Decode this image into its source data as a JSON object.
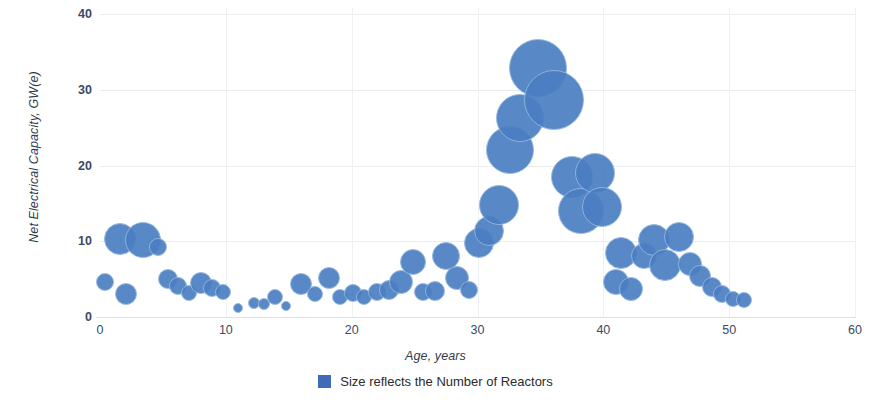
{
  "chart_data": {
    "type": "scatter",
    "title": "",
    "xlabel": "Age, years",
    "ylabel": "Net Electrical Capacity, GW(e)",
    "xlim": [
      0,
      60
    ],
    "ylim": [
      0,
      40
    ],
    "xticks": [
      "0",
      "10",
      "20",
      "30",
      "40",
      "50",
      "60"
    ],
    "xtick_values": [
      0,
      10,
      20,
      30,
      40,
      50,
      60
    ],
    "yticks": [
      "0",
      "10",
      "20",
      "30",
      "40"
    ],
    "ytick_values": [
      0,
      10,
      20,
      30,
      40
    ],
    "grid": "horizontal and vertical, light gray",
    "legend_position": "bottom-center",
    "series_name": "Size reflects the Number of Reactors",
    "bubble_color": "#4a7ec2",
    "bubble_stroke": "#93b6de",
    "legend_swatch_color": "#3c6cb8",
    "note": "Bubble area reflects the number of reactors at that age.",
    "points": [
      {
        "x": 0.4,
        "y": 4.6,
        "r": 9
      },
      {
        "x": 1.6,
        "y": 10.3,
        "r": 16
      },
      {
        "x": 2.1,
        "y": 3.1,
        "r": 11
      },
      {
        "x": 3.4,
        "y": 10.1,
        "r": 18
      },
      {
        "x": 4.6,
        "y": 9.3,
        "r": 9
      },
      {
        "x": 5.4,
        "y": 5.0,
        "r": 10
      },
      {
        "x": 6.2,
        "y": 4.1,
        "r": 9
      },
      {
        "x": 7.1,
        "y": 3.2,
        "r": 8
      },
      {
        "x": 8.0,
        "y": 4.5,
        "r": 11
      },
      {
        "x": 8.9,
        "y": 3.8,
        "r": 9
      },
      {
        "x": 9.8,
        "y": 3.3,
        "r": 8
      },
      {
        "x": 11.0,
        "y": 1.2,
        "r": 5
      },
      {
        "x": 12.2,
        "y": 1.9,
        "r": 6
      },
      {
        "x": 13.0,
        "y": 1.7,
        "r": 6
      },
      {
        "x": 13.9,
        "y": 2.6,
        "r": 8
      },
      {
        "x": 14.8,
        "y": 1.5,
        "r": 5
      },
      {
        "x": 16.0,
        "y": 4.3,
        "r": 11
      },
      {
        "x": 17.1,
        "y": 3.0,
        "r": 8
      },
      {
        "x": 18.2,
        "y": 5.1,
        "r": 11
      },
      {
        "x": 19.1,
        "y": 2.6,
        "r": 8
      },
      {
        "x": 20.1,
        "y": 3.2,
        "r": 9
      },
      {
        "x": 21.0,
        "y": 2.7,
        "r": 8
      },
      {
        "x": 22.0,
        "y": 3.3,
        "r": 9
      },
      {
        "x": 23.0,
        "y": 3.5,
        "r": 10
      },
      {
        "x": 23.9,
        "y": 4.6,
        "r": 12
      },
      {
        "x": 24.9,
        "y": 7.2,
        "r": 13
      },
      {
        "x": 25.7,
        "y": 3.3,
        "r": 9
      },
      {
        "x": 26.6,
        "y": 3.4,
        "r": 10
      },
      {
        "x": 27.5,
        "y": 8.0,
        "r": 14
      },
      {
        "x": 28.4,
        "y": 5.2,
        "r": 12
      },
      {
        "x": 29.3,
        "y": 3.5,
        "r": 9
      },
      {
        "x": 30.1,
        "y": 9.8,
        "r": 15
      },
      {
        "x": 30.9,
        "y": 11.3,
        "r": 15
      },
      {
        "x": 31.7,
        "y": 14.8,
        "r": 20
      },
      {
        "x": 32.6,
        "y": 22.0,
        "r": 24
      },
      {
        "x": 33.4,
        "y": 26.3,
        "r": 24
      },
      {
        "x": 34.8,
        "y": 32.9,
        "r": 29
      },
      {
        "x": 36.1,
        "y": 28.6,
        "r": 30
      },
      {
        "x": 37.5,
        "y": 18.5,
        "r": 21
      },
      {
        "x": 38.2,
        "y": 14.0,
        "r": 23
      },
      {
        "x": 39.3,
        "y": 19.0,
        "r": 20
      },
      {
        "x": 39.9,
        "y": 14.5,
        "r": 20
      },
      {
        "x": 41.0,
        "y": 4.6,
        "r": 13
      },
      {
        "x": 41.4,
        "y": 8.4,
        "r": 16
      },
      {
        "x": 42.2,
        "y": 3.7,
        "r": 12
      },
      {
        "x": 43.2,
        "y": 8.0,
        "r": 13
      },
      {
        "x": 44.0,
        "y": 10.2,
        "r": 16
      },
      {
        "x": 44.9,
        "y": 6.8,
        "r": 16
      },
      {
        "x": 46.0,
        "y": 10.6,
        "r": 15
      },
      {
        "x": 46.9,
        "y": 7.0,
        "r": 12
      },
      {
        "x": 47.7,
        "y": 5.4,
        "r": 11
      },
      {
        "x": 48.6,
        "y": 4.0,
        "r": 10
      },
      {
        "x": 49.4,
        "y": 3.1,
        "r": 9
      },
      {
        "x": 50.3,
        "y": 2.4,
        "r": 8
      },
      {
        "x": 51.2,
        "y": 2.3,
        "r": 8
      }
    ]
  },
  "legend": {
    "label": "Size reflects the Number of Reactors"
  }
}
